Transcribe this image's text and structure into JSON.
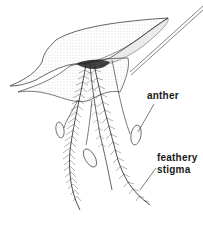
{
  "diagram": {
    "labels": {
      "anther": "anther",
      "stigma_line1": "feathery",
      "stigma_line2": "stigma"
    }
  }
}
